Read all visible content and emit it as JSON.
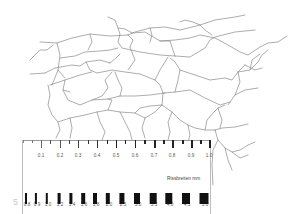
{
  "figure": {
    "stroke_color": "#8a8a8a"
  },
  "ruler": {
    "top_scale": {
      "unit_step": 0.05,
      "labels": [
        "0.1",
        "0.2",
        "0.3",
        "0.4",
        "0.5",
        "0.6",
        "0.7",
        "0.8",
        "0.9",
        "1.0"
      ]
    },
    "crack_widths": {
      "caption": "Rissbreiten mm",
      "labels": [
        "0.8",
        "0.9",
        "1.0",
        "1.2",
        "1.4",
        "1.6",
        "1.8",
        "2.0",
        "2.5",
        "3.0",
        "3.5",
        "4.0",
        "4.5",
        "5.0"
      ]
    }
  },
  "page_number": "5"
}
